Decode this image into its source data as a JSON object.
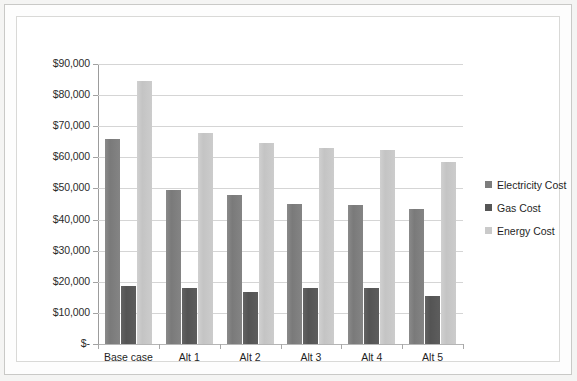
{
  "chart_data": {
    "type": "bar",
    "title": "",
    "subtitle": "",
    "xlabel": "",
    "ylabel": "",
    "categories": [
      "Base case",
      "Alt 1",
      "Alt 2",
      "Alt 3",
      "Alt 4",
      "Alt 5"
    ],
    "series": [
      {
        "name": "Electricity Cost",
        "color": "#7d7d7d",
        "values": [
          66000,
          49500,
          48000,
          45100,
          44700,
          43400
        ]
      },
      {
        "name": "Gas Cost",
        "color": "#565656",
        "values": [
          18800,
          17900,
          16800,
          18100,
          18100,
          15500
        ]
      },
      {
        "name": "Energy Cost",
        "color": "#cacaca",
        "values": [
          84400,
          67700,
          64700,
          63000,
          62500,
          58500
        ]
      }
    ],
    "ylim": [
      0,
      90000
    ],
    "y_ticks": [
      0,
      10000,
      20000,
      30000,
      40000,
      50000,
      60000,
      70000,
      80000,
      90000
    ],
    "y_tick_labels": [
      "$-",
      "$10,000",
      "$20,000",
      "$30,000",
      "$40,000",
      "$50,000",
      "$60,000",
      "$70,000",
      "$80,000",
      "$90,000"
    ],
    "grid": true,
    "grid_axis": "y",
    "legend_position": "right",
    "legend_entries": [
      "Electricity Cost",
      "Gas Cost",
      "Energy Cost"
    ],
    "currency_prefix": "$"
  }
}
